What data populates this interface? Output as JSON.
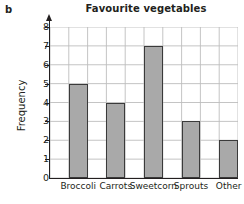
{
  "figure": {
    "part_label": "b"
  },
  "chart_data": {
    "type": "bar",
    "title": "Favourite vegetables",
    "xlabel": "",
    "ylabel": "Frequency",
    "categories": [
      "Broccoli",
      "Carrots",
      "Sweetcorn",
      "Sprouts",
      "Other"
    ],
    "values": [
      5,
      4,
      7,
      3,
      2
    ],
    "ylim": [
      0,
      8
    ],
    "ytick_labels": [
      "8",
      "7",
      "6",
      "5",
      "4",
      "3",
      "2",
      "1",
      "0"
    ],
    "ytick_values": [
      8,
      7,
      6,
      5,
      4,
      3,
      2,
      1,
      0
    ],
    "grid": "both",
    "grid_columns": 10,
    "legend": "none",
    "bar_fill_color": "#a9a9a9",
    "bar_edge_color": "#3a3a3a",
    "grid_color": "#bdbdbd",
    "axis_color": "#231f20",
    "background_color": "#ffffff"
  }
}
